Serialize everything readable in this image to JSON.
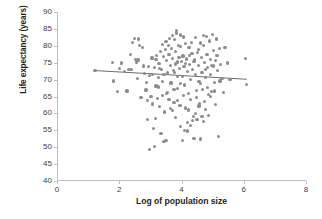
{
  "chart_data": {
    "type": "scatter",
    "title": "",
    "xlabel": "Log of population size",
    "ylabel": "Life expectancy (years)",
    "xlim": [
      0,
      8
    ],
    "ylim": [
      40,
      90
    ],
    "xticks": [
      0,
      2,
      4,
      6,
      8
    ],
    "yticks": [
      40,
      45,
      50,
      55,
      60,
      65,
      70,
      75,
      80,
      85,
      90
    ],
    "grid": false,
    "legend": null,
    "marker_color": "#8d8d8d",
    "trendline": {
      "color": "#6e6e6e",
      "x": [
        1.2,
        6.1
      ],
      "y": [
        72.8,
        70.2
      ]
    },
    "points": [
      [
        1.22,
        72.8
      ],
      [
        1.78,
        75.0
      ],
      [
        1.82,
        69.6
      ],
      [
        1.95,
        66.4
      ],
      [
        2.02,
        73.2
      ],
      [
        2.08,
        74.9
      ],
      [
        2.18,
        72.5
      ],
      [
        2.25,
        66.6
      ],
      [
        2.3,
        72.9
      ],
      [
        2.38,
        73.0
      ],
      [
        2.42,
        80.9
      ],
      [
        2.48,
        82.2
      ],
      [
        2.52,
        76.0
      ],
      [
        2.55,
        75.2
      ],
      [
        2.58,
        70.3
      ],
      [
        2.62,
        82.0
      ],
      [
        2.66,
        80.1
      ],
      [
        2.7,
        64.8
      ],
      [
        2.74,
        79.6
      ],
      [
        2.78,
        74.0
      ],
      [
        2.82,
        71.8
      ],
      [
        2.86,
        66.9
      ],
      [
        2.9,
        63.7
      ],
      [
        2.92,
        58.1
      ],
      [
        2.96,
        71.2
      ],
      [
        2.98,
        49.2
      ],
      [
        3.02,
        65.0
      ],
      [
        3.05,
        76.4
      ],
      [
        3.08,
        62.8
      ],
      [
        3.1,
        55.6
      ],
      [
        3.12,
        73.6
      ],
      [
        3.14,
        50.3
      ],
      [
        3.18,
        68.1
      ],
      [
        3.2,
        77.2
      ],
      [
        3.22,
        64.5
      ],
      [
        3.25,
        70.6
      ],
      [
        3.28,
        74.8
      ],
      [
        3.3,
        62.0
      ],
      [
        3.33,
        78.2
      ],
      [
        3.36,
        73.1
      ],
      [
        3.38,
        65.4
      ],
      [
        3.4,
        80.5
      ],
      [
        3.42,
        76.8
      ],
      [
        3.44,
        71.5
      ],
      [
        3.46,
        60.4
      ],
      [
        3.48,
        78.9
      ],
      [
        3.5,
        81.2
      ],
      [
        3.52,
        75.6
      ],
      [
        3.54,
        72.2
      ],
      [
        3.56,
        66.2
      ],
      [
        3.58,
        80.0
      ],
      [
        3.6,
        77.5
      ],
      [
        3.62,
        82.1
      ],
      [
        3.64,
        74.2
      ],
      [
        3.66,
        69.0
      ],
      [
        3.68,
        79.1
      ],
      [
        3.7,
        83.0
      ],
      [
        3.72,
        76.2
      ],
      [
        3.74,
        72.7
      ],
      [
        3.76,
        63.2
      ],
      [
        3.78,
        81.8
      ],
      [
        3.8,
        78.4
      ],
      [
        3.82,
        74.6
      ],
      [
        3.84,
        84.6
      ],
      [
        3.85,
        83.8
      ],
      [
        3.86,
        71.0
      ],
      [
        3.88,
        67.3
      ],
      [
        3.9,
        80.2
      ],
      [
        3.92,
        76.6
      ],
      [
        3.94,
        73.4
      ],
      [
        3.95,
        62.4
      ],
      [
        3.96,
        83.2
      ],
      [
        3.98,
        79.8
      ],
      [
        4.0,
        75.4
      ],
      [
        4.02,
        70.8
      ],
      [
        4.04,
        52.0
      ],
      [
        4.05,
        77.0
      ],
      [
        4.06,
        82.6
      ],
      [
        4.08,
        73.8
      ],
      [
        4.1,
        68.4
      ],
      [
        4.12,
        61.6
      ],
      [
        4.14,
        80.6
      ],
      [
        4.16,
        76.1
      ],
      [
        4.18,
        72.4
      ],
      [
        4.2,
        57.2
      ],
      [
        4.22,
        66.0
      ],
      [
        4.24,
        79.4
      ],
      [
        4.26,
        74.4
      ],
      [
        4.28,
        70.1
      ],
      [
        4.3,
        64.2
      ],
      [
        4.32,
        81.0
      ],
      [
        4.34,
        77.8
      ],
      [
        4.36,
        73.0
      ],
      [
        4.38,
        59.0
      ],
      [
        4.4,
        52.6
      ],
      [
        4.42,
        75.8
      ],
      [
        4.44,
        82.4
      ],
      [
        4.46,
        71.6
      ],
      [
        4.48,
        66.8
      ],
      [
        4.5,
        58.2
      ],
      [
        4.52,
        78.0
      ],
      [
        4.54,
        74.1
      ],
      [
        4.56,
        69.4
      ],
      [
        4.58,
        63.0
      ],
      [
        4.6,
        52.4
      ],
      [
        4.62,
        80.8
      ],
      [
        4.64,
        76.5
      ],
      [
        4.66,
        72.0
      ],
      [
        4.68,
        67.0
      ],
      [
        4.7,
        57.6
      ],
      [
        4.72,
        83.0
      ],
      [
        4.74,
        75.0
      ],
      [
        4.76,
        70.5
      ],
      [
        4.78,
        61.2
      ],
      [
        4.8,
        82.8
      ],
      [
        4.82,
        77.4
      ],
      [
        4.84,
        73.5
      ],
      [
        4.86,
        65.6
      ],
      [
        4.88,
        59.4
      ],
      [
        4.9,
        81.4
      ],
      [
        4.92,
        76.0
      ],
      [
        4.94,
        71.4
      ],
      [
        4.96,
        66.4
      ],
      [
        5.0,
        83.4
      ],
      [
        5.02,
        78.6
      ],
      [
        5.04,
        74.0
      ],
      [
        5.06,
        69.2
      ],
      [
        5.08,
        62.6
      ],
      [
        5.12,
        82.0
      ],
      [
        5.14,
        77.1
      ],
      [
        5.16,
        72.6
      ],
      [
        5.18,
        53.2
      ],
      [
        5.22,
        79.2
      ],
      [
        5.26,
        74.5
      ],
      [
        5.3,
        70.4
      ],
      [
        5.34,
        66.2
      ],
      [
        5.4,
        79.4
      ],
      [
        5.48,
        74.9
      ],
      [
        5.56,
        70.0
      ],
      [
        6.05,
        76.2
      ],
      [
        6.1,
        68.6
      ],
      [
        2.35,
        77.4
      ],
      [
        2.6,
        75.8
      ],
      [
        3.16,
        58.6
      ],
      [
        3.34,
        54.0
      ],
      [
        3.44,
        51.8
      ],
      [
        3.5,
        51.9
      ],
      [
        3.6,
        64.0
      ],
      [
        3.7,
        60.8
      ],
      [
        3.82,
        58.8
      ],
      [
        3.96,
        56.2
      ],
      [
        4.1,
        55.0
      ],
      [
        4.18,
        54.8
      ],
      [
        4.3,
        56.4
      ],
      [
        4.44,
        60.0
      ],
      [
        4.56,
        62.2
      ],
      [
        4.66,
        59.2
      ],
      [
        4.74,
        63.6
      ],
      [
        4.84,
        67.6
      ],
      [
        2.88,
        69.2
      ],
      [
        3.06,
        71.6
      ],
      [
        3.26,
        67.8
      ],
      [
        3.52,
        65.8
      ],
      [
        3.64,
        61.4
      ],
      [
        3.76,
        67.1
      ],
      [
        3.88,
        63.8
      ],
      [
        4.06,
        65.2
      ],
      [
        4.22,
        61.0
      ],
      [
        4.36,
        57.8
      ],
      [
        4.48,
        64.6
      ],
      [
        4.62,
        68.8
      ],
      [
        4.78,
        72.9
      ],
      [
        5.06,
        66.6
      ],
      [
        5.24,
        69.6
      ],
      [
        4.92,
        65.0
      ],
      [
        3.98,
        68.8
      ],
      [
        3.86,
        75.2
      ],
      [
        3.78,
        72.1
      ],
      [
        4.14,
        74.8
      ],
      [
        4.26,
        77.2
      ],
      [
        4.4,
        75.4
      ],
      [
        4.54,
        78.8
      ],
      [
        4.7,
        80.2
      ],
      [
        4.96,
        74.2
      ],
      [
        5.1,
        75.6
      ],
      [
        3.3,
        73.4
      ],
      [
        3.18,
        75.9
      ],
      [
        2.94,
        73.8
      ],
      [
        3.4,
        69.4
      ],
      [
        3.56,
        71.8
      ]
    ]
  },
  "axes": {
    "ylabel_text": "Life expectancy (years)",
    "xlabel_text": "Log of population size",
    "yticks_text": [
      "90",
      "85",
      "80",
      "75",
      "70",
      "65",
      "60",
      "55",
      "50",
      "45",
      "40"
    ],
    "xticks_text": [
      "0",
      "2",
      "4",
      "6",
      "8"
    ]
  }
}
